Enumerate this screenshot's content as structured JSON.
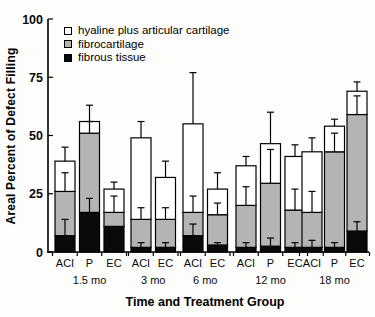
{
  "chart_data": {
    "type": "bar",
    "stacked": true,
    "title": "",
    "ylabel": "Areal Percent of Defect Filling",
    "xlabel": "Time and Treatment Group",
    "ylim": [
      0,
      100
    ],
    "yticks": [
      0,
      25,
      50,
      75,
      100
    ],
    "grid": false,
    "legend_position": "top-left-inside",
    "legend": [
      {
        "label": "hyaline plus articular cartilage",
        "color": "#ffffff"
      },
      {
        "label": "fibrocartilage",
        "color": "#b4b4b4"
      },
      {
        "label": "fibrous tissue",
        "color": "#0a0a0a"
      }
    ],
    "series_bottom_to_top": [
      "fibrous tissue",
      "fibrocartilage",
      "hyaline plus articular cartilage"
    ],
    "colors": {
      "fibrous tissue": "#0a0a0a",
      "fibrocartilage": "#b4b4b4",
      "hyaline plus articular cartilage": "#ffffff"
    },
    "groups": [
      {
        "label": "1.5 mo",
        "bars": [
          {
            "label": "ACI",
            "values": {
              "fibrous tissue": 7,
              "fibrocartilage": 19,
              "hyaline plus articular cartilage": 13
            },
            "error_caps": [
              14,
              34,
              45
            ]
          },
          {
            "label": "P",
            "values": {
              "fibrous tissue": 17,
              "fibrocartilage": 34,
              "hyaline plus articular cartilage": 5
            },
            "error_caps": [
              23,
              56,
              63
            ]
          },
          {
            "label": "EC",
            "values": {
              "fibrous tissue": 11,
              "fibrocartilage": 6,
              "hyaline plus articular cartilage": 10
            },
            "error_caps": [
              null,
              24,
              30
            ]
          }
        ]
      },
      {
        "label": "3 mo",
        "bars": [
          {
            "label": "ACI",
            "values": {
              "fibrous tissue": 2,
              "fibrocartilage": 12,
              "hyaline plus articular cartilage": 35
            },
            "error_caps": [
              4,
              19,
              56
            ]
          },
          {
            "label": "EC",
            "values": {
              "fibrous tissue": 2,
              "fibrocartilage": 12,
              "hyaline plus articular cartilage": 18
            },
            "error_caps": [
              4,
              19,
              39
            ]
          }
        ]
      },
      {
        "label": "6 mo",
        "bars": [
          {
            "label": "ACI",
            "values": {
              "fibrous tissue": 7,
              "fibrocartilage": 10,
              "hyaline plus articular cartilage": 38
            },
            "error_caps": [
              12,
              24,
              77
            ]
          },
          {
            "label": "EC",
            "values": {
              "fibrous tissue": 3,
              "fibrocartilage": 13,
              "hyaline plus articular cartilage": 11
            },
            "error_caps": [
              4,
              21,
              34
            ]
          }
        ]
      },
      {
        "label": "12 mo",
        "bars": [
          {
            "label": "ACI",
            "values": {
              "fibrous tissue": 2,
              "fibrocartilage": 18,
              "hyaline plus articular cartilage": 17
            },
            "error_caps": [
              4,
              28,
              41
            ]
          },
          {
            "label": "P",
            "values": {
              "fibrous tissue": 2.5,
              "fibrocartilage": 27,
              "hyaline plus articular cartilage": 17
            },
            "error_caps": [
              6,
              44,
              60
            ]
          },
          {
            "label": "EC",
            "values": {
              "fibrous tissue": 2,
              "fibrocartilage": 16,
              "hyaline plus articular cartilage": 23
            },
            "error_caps": [
              4,
              27,
              46
            ]
          }
        ]
      },
      {
        "label": "18 mo",
        "bars": [
          {
            "label": "ACI",
            "values": {
              "fibrous tissue": 2,
              "fibrocartilage": 15,
              "hyaline plus articular cartilage": 26
            },
            "error_caps": [
              5,
              26,
              49
            ]
          },
          {
            "label": "P",
            "values": {
              "fibrous tissue": 2,
              "fibrocartilage": 41,
              "hyaline plus articular cartilage": 11
            },
            "error_caps": [
              4,
              51,
              57
            ]
          },
          {
            "label": "EC",
            "values": {
              "fibrous tissue": 9,
              "fibrocartilage": 50,
              "hyaline plus articular cartilage": 10
            },
            "error_caps": [
              13,
              67,
              73
            ]
          }
        ]
      }
    ]
  }
}
